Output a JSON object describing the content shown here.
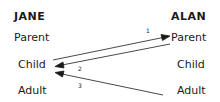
{
  "diagram": {
    "left": {
      "name": "JANE",
      "states": [
        "Parent",
        "Child",
        "Adult"
      ]
    },
    "right": {
      "name": "ALAN",
      "states": [
        "Parent",
        "Child",
        "Adult"
      ]
    },
    "transactions": [
      {
        "label": "1",
        "from": "JANE.Child",
        "to": "ALAN.Parent"
      },
      {
        "label": "2",
        "from": "ALAN.Parent",
        "to": "JANE.Child"
      },
      {
        "label": "3",
        "from": "ALAN.Adult",
        "to": "JANE.Child"
      }
    ]
  }
}
